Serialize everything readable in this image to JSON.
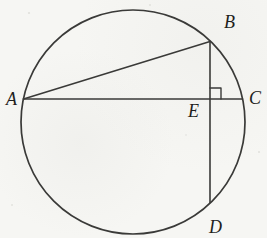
{
  "diagram": {
    "type": "geometry",
    "shape": "circle-with-chords",
    "circle": {
      "cx": 133,
      "cy": 122,
      "r": 112
    },
    "points": {
      "A": {
        "x": 23.5,
        "y": 99
      },
      "B": {
        "x": 210,
        "y": 41.5
      },
      "C": {
        "x": 242.5,
        "y": 99
      },
      "D": {
        "x": 210,
        "y": 202.5
      },
      "E": {
        "x": 210,
        "y": 99
      }
    },
    "segments": [
      {
        "from": "A",
        "to": "C"
      },
      {
        "from": "A",
        "to": "B"
      },
      {
        "from": "B",
        "to": "D"
      }
    ],
    "right_angle_marker": {
      "at": "E",
      "between": [
        "EB",
        "EC"
      ],
      "size": 11
    },
    "labels": {
      "A": "A",
      "B": "B",
      "C": "C",
      "D": "D",
      "E": "E"
    },
    "colors": {
      "line": "#3a3a38",
      "label": "#1f1f1d",
      "background": "#f6f6f3",
      "speckle": "#b9b9b2"
    }
  }
}
